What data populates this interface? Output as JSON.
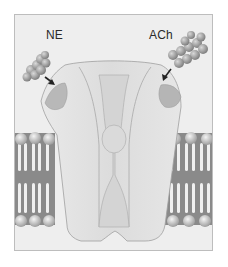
{
  "figure": {
    "labels": {
      "left_ligand": "NE",
      "right_ligand": "ACh"
    },
    "colors": {
      "background": "#eeeeee",
      "frame_border": "#bdbdbd",
      "protein_fill": "#e4e4e4",
      "binding_site": "#b5b5b5",
      "membrane_dark": "#8a8a8a",
      "lipid_head": "#c8c8c8",
      "arrow": "#222222"
    }
  }
}
